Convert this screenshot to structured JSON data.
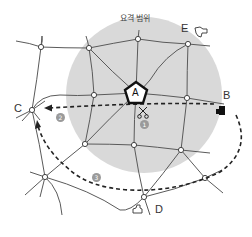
{
  "diagram": {
    "range_label": "요격 범위",
    "center_point": {
      "label": "A"
    },
    "points": [
      {
        "id": "B",
        "label": "B",
        "icon": "factory-icon"
      },
      {
        "id": "C",
        "label": "C"
      },
      {
        "id": "D",
        "label": "D",
        "icon": "building-outline-icon"
      },
      {
        "id": "E",
        "label": "E",
        "icon": "building-outline-icon"
      }
    ],
    "routes": [
      {
        "number": "1",
        "marker": "①",
        "icon": "scissors-icon",
        "description": "B to C through range near A"
      },
      {
        "number": "2",
        "marker": "②",
        "description": "dashed arrow to C"
      },
      {
        "number": "3",
        "marker": "③",
        "description": "dashed route around the south side to C"
      }
    ],
    "colors": {
      "range_fill": "#d9d9d9",
      "road": "#555555",
      "node_fill": "#ffffff",
      "route_dash": "#222222",
      "marker_badge": "#9a9a9a"
    }
  }
}
